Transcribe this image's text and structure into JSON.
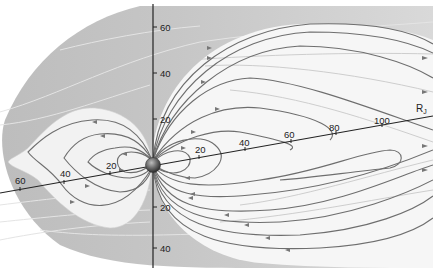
{
  "diagram": {
    "unit_label_main": "R",
    "unit_label_sub": "J",
    "colors": {
      "background": "#ffffff",
      "magnetosheath": "#c4c4c4",
      "magnetosphere": "#f4f4f4",
      "field_line": "#6e6e6e",
      "axis": "#222222",
      "planet": "#555555"
    },
    "vertical_axis": {
      "ticks_up": [
        "60",
        "40",
        "20"
      ],
      "ticks_down": [
        "20",
        "40"
      ]
    },
    "equatorial_axis": {
      "ticks_right": [
        "20",
        "40",
        "60",
        "80",
        "100"
      ],
      "ticks_left": [
        "20",
        "40",
        "60"
      ]
    }
  }
}
